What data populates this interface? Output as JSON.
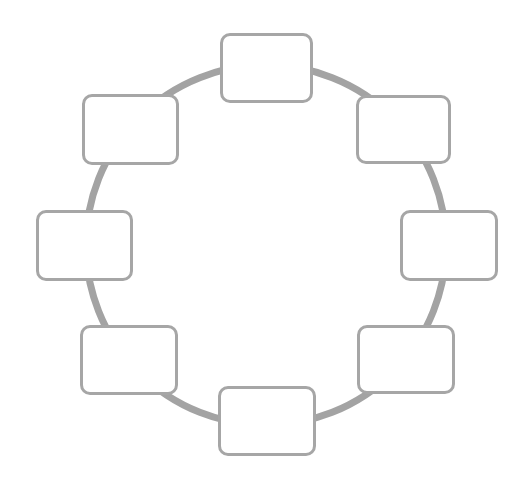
{
  "diagram": {
    "type": "cycle",
    "ring": {
      "cx": 266,
      "cy": 245,
      "r": 180,
      "stroke": "#a3a3a3",
      "stroke_width": 7
    },
    "node_border_color": "#a6a6a6",
    "nodes": [
      {
        "id": "top",
        "label": "",
        "x": 220,
        "y": 33,
        "w": 93,
        "h": 70
      },
      {
        "id": "top-right",
        "label": "",
        "x": 356,
        "y": 95,
        "w": 95,
        "h": 69
      },
      {
        "id": "right",
        "label": "",
        "x": 400,
        "y": 210,
        "w": 98,
        "h": 71
      },
      {
        "id": "bottom-right",
        "label": "",
        "x": 357,
        "y": 325,
        "w": 98,
        "h": 69
      },
      {
        "id": "bottom",
        "label": "",
        "x": 218,
        "y": 386,
        "w": 98,
        "h": 70
      },
      {
        "id": "bottom-left",
        "label": "",
        "x": 80,
        "y": 325,
        "w": 98,
        "h": 70
      },
      {
        "id": "left",
        "label": "",
        "x": 36,
        "y": 210,
        "w": 97,
        "h": 71
      },
      {
        "id": "top-left",
        "label": "",
        "x": 82,
        "y": 94,
        "w": 97,
        "h": 71
      }
    ]
  }
}
